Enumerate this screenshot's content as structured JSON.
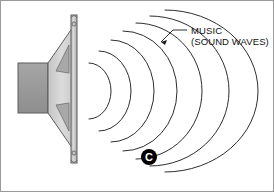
{
  "figure": {
    "name": "loudspeaker-sound-waves-diagram",
    "background_color": "#ffffff",
    "border_color": "#9a9a9a",
    "width": 274,
    "height": 192
  },
  "callout": {
    "line1": "MUSIC",
    "line2": "(SOUND WAVES)",
    "text_color": "#111111",
    "leader_color": "#1a1a1a"
  },
  "marker": {
    "label": "C",
    "fill_color": "#000000",
    "text_color": "#ffffff"
  },
  "speaker": {
    "magnet_label": "magnet-body",
    "magnet_fill": "#9e9e9e",
    "cone_fill": "#d6d6d6",
    "cone_facet_fill": "#a8a8a8",
    "frame_fill": "#c9c9c9",
    "outline_color": "#5c5c5c"
  },
  "waves": {
    "count": 7,
    "stroke_color": "#2e2e2e",
    "label": "sound-wave-arcs"
  }
}
